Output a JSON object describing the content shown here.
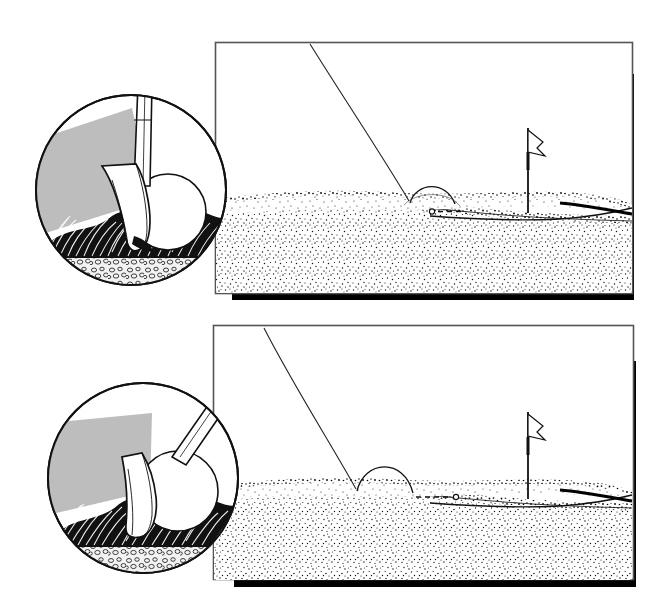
{
  "illustration": {
    "title": "Golf shot comparison: clubface presentation vs. ball flight and roll",
    "subject": "golf-wedge-impact-and-green-reaction",
    "style": "black-and-white pen-and-ink line drawing with stipple shading",
    "background_color": "#ffffff",
    "ink_color": "#111111",
    "shadow_gray": "#bdbdbd",
    "panel_count": 2
  },
  "panels": [
    {
      "id": "panel-top",
      "name": "steep-descending-shot",
      "frame": {
        "x": 215,
        "y": 42,
        "width": 418,
        "height": 252,
        "border_color": "#555555",
        "border_width": 1.5,
        "shadow_color": "#000000",
        "shadow_offset_x": 6,
        "shadow_offset_y": 6
      },
      "inset": {
        "name": "impact-closeup-top",
        "shape": "circle",
        "center_x": 131,
        "center_y": 190,
        "radius": 96,
        "contents": [
          "club-shaft",
          "wedge-clubhead-square-steep",
          "golf-ball",
          "grass-blades",
          "soil-and-pebbles",
          "gray-shadow-wedge"
        ],
        "club_angle_deg": 10,
        "club_description": "club shaft near vertical, leading edge digging steeply into turf"
      },
      "scene": {
        "green_surface_y": 200,
        "flag": {
          "x": 528,
          "base_y": 213,
          "top_y": 128
        },
        "trajectory": {
          "type": "descending-line",
          "enters_frame_at_x": 310,
          "enters_frame_at_y": 44,
          "lands_at_x": 408,
          "lands_at_y": 201,
          "descent": "steep"
        },
        "bounce": {
          "type": "arc",
          "start_x": 412,
          "end_x": 455,
          "peak_y": 185,
          "height": 16,
          "description": "single high short hop"
        },
        "roll": {
          "style": "dashed",
          "start_x": 432,
          "end_x": 462,
          "y": 211,
          "ball_marker_x": 432,
          "distance": "short",
          "stops_before_flag": true
        }
      }
    },
    {
      "id": "panel-bottom",
      "name": "shallow-open-face-shot",
      "frame": {
        "x": 213,
        "y": 325,
        "width": 421,
        "height": 255,
        "border_color": "#555555",
        "border_width": 1.5,
        "shadow_color": "#000000",
        "shadow_offset_x": 6,
        "shadow_offset_y": 6
      },
      "inset": {
        "name": "impact-closeup-bottom",
        "shape": "circle",
        "center_x": 143,
        "center_y": 478,
        "radius": 96,
        "contents": [
          "club-shaft",
          "wedge-clubhead-open-shallow",
          "golf-ball",
          "grass-blades",
          "soil-and-pebbles",
          "gray-shadow-wedge"
        ],
        "club_angle_deg": 42,
        "club_description": "shaft laid back, clubface open and sliding shallow under the ball"
      },
      "scene": {
        "green_surface_y": 487,
        "flag": {
          "x": 528,
          "base_y": 498,
          "top_y": 412
        },
        "trajectory": {
          "type": "descending-line",
          "enters_frame_at_x": 264,
          "enters_frame_at_y": 328,
          "lands_at_x": 356,
          "lands_at_y": 488,
          "descent": "steep"
        },
        "bounce": {
          "type": "arc",
          "start_x": 357,
          "end_x": 412,
          "peak_y": 463,
          "height": 24,
          "description": "single higher hop, longer carry"
        },
        "roll": {
          "style": "dashed",
          "start_x": 415,
          "end_x": 455,
          "y": 497,
          "ball_marker_x": 455,
          "distance": "long",
          "stops_near_flag": true
        }
      }
    }
  ],
  "legend_labels": {
    "ball_marker": "o",
    "roll_path": "- - -"
  }
}
